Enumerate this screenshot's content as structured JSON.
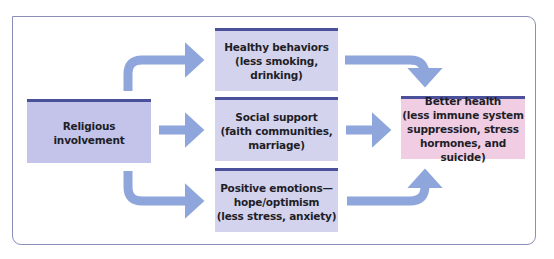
{
  "diagram": {
    "type": "flowchart",
    "source_node": {
      "label": "Religious involvement"
    },
    "mediators": [
      {
        "label": "Healthy behaviors\n(less smoking, drinking)"
      },
      {
        "label": "Social support\n(faith communities,\nmarriage)"
      },
      {
        "label": "Positive emotions—\nhope/optimism\n(less stress, anxiety)"
      }
    ],
    "outcome_node": {
      "label": "Better health\n(less immune system\nsuppression, stress\nhormones, and suicide)"
    },
    "edges": [
      {
        "from": "Religious involvement",
        "to": "Healthy behaviors"
      },
      {
        "from": "Religious involvement",
        "to": "Social support"
      },
      {
        "from": "Religious involvement",
        "to": "Positive emotions"
      },
      {
        "from": "Healthy behaviors",
        "to": "Better health"
      },
      {
        "from": "Social support",
        "to": "Better health"
      },
      {
        "from": "Positive emotions",
        "to": "Better health"
      }
    ],
    "colors": {
      "source_fill": "#c4c4ea",
      "mediator_fill": "#d4d3ee",
      "outcome_fill": "#f0cde2",
      "box_top_rule": "#4a5099",
      "arrow": "#8ea6dc",
      "frame_border": "#8a8fb8"
    }
  }
}
